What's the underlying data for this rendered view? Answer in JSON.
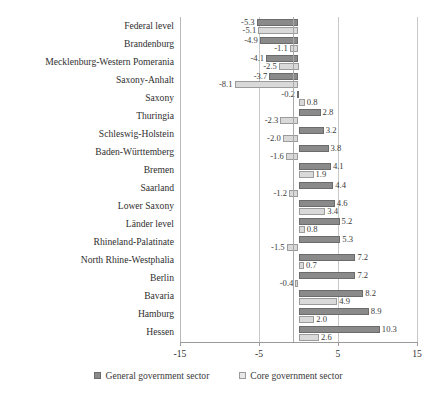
{
  "chart_data": {
    "type": "bar",
    "orientation": "horizontal",
    "title": "",
    "xlabel": "",
    "ylabel": "",
    "xlim": [
      -15,
      15
    ],
    "xticks": [
      "-15",
      "-5",
      "5",
      "15"
    ],
    "xtick_values": [
      -15,
      -5,
      5,
      15
    ],
    "grid": true,
    "legend_position": "bottom",
    "categories": [
      "Federal level",
      "Brandenburg",
      "Mecklenburg-Western Pomerania",
      "Saxony-Anhalt",
      "Saxony",
      "Thuringia",
      "Schleswig-Holstein",
      "Baden-Württemberg",
      "Bremen",
      "Saarland",
      "Lower Saxony",
      "Länder level",
      "Rhineland-Palatinate",
      "North Rhine-Westphalia",
      "Berlin",
      "Bavaria",
      "Hamburg",
      "Hessen"
    ],
    "series": [
      {
        "name": "General government sector",
        "color": "#8a8a8a",
        "values": [
          -5.3,
          -4.9,
          -4.1,
          -3.7,
          -0.2,
          2.8,
          3.2,
          3.8,
          4.1,
          4.4,
          4.6,
          5.2,
          5.3,
          7.2,
          7.2,
          8.2,
          8.9,
          10.3
        ],
        "labels": [
          "-5.3",
          "-4.9",
          "-4.1",
          "-3.7",
          "-0.2",
          "2.8",
          "3.2",
          "3.8",
          "4.1",
          "4.4",
          "4.6",
          "5.2",
          "5.3",
          "7.2",
          "7.2",
          "8.2",
          "8.9",
          "10.3"
        ]
      },
      {
        "name": "Core government sector",
        "color": "#d9d9d9",
        "values": [
          -5.1,
          -1.1,
          -2.5,
          -8.1,
          0.8,
          -2.3,
          -2.0,
          -1.6,
          1.9,
          -1.2,
          3.4,
          0.8,
          -1.5,
          0.7,
          -0.4,
          4.9,
          2.0,
          2.6
        ],
        "labels": [
          "-5.1",
          "-1.1",
          "-2.5",
          "-8.1",
          "0.8",
          "-2.3",
          "-2.0",
          "-1.6",
          "1.9",
          "-1.2",
          "3.4",
          "0.8",
          "-1.5",
          "0.7",
          "-0.4",
          "4.9",
          "2.0",
          "2.6"
        ]
      }
    ],
    "legend": [
      {
        "label": "General government sector",
        "swatch": "dark-gray-square"
      },
      {
        "label": "Core government sector",
        "swatch": "light-gray-square"
      }
    ]
  }
}
